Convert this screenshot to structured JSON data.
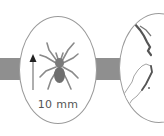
{
  "diagram": {
    "connector": {
      "color": "#8f8f8f"
    },
    "panels": [
      {
        "id": "spider-panel",
        "subject": "spider-icon",
        "scale_label": "10 mm",
        "scale_arrow": "up-arrow-icon"
      },
      {
        "id": "map-panel",
        "subject": "new-zealand-map-icon"
      }
    ],
    "colors": {
      "outline": "#9a9a9a",
      "spider_body": "#6f6f6f",
      "spider_legs": "#8a8a8a",
      "arrow_head": "#222222",
      "arrow_shaft": "#9a9a9a",
      "map_stroke": "#7a7a7a"
    }
  }
}
